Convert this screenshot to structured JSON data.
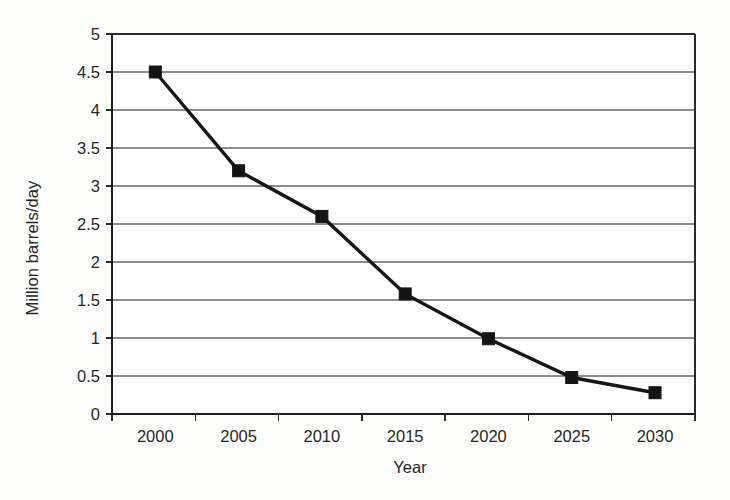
{
  "chart_data": {
    "type": "line",
    "title": "",
    "xlabel": "Year",
    "ylabel": "Million barrels/day",
    "x": [
      2000,
      2005,
      2010,
      2015,
      2020,
      2025,
      2030
    ],
    "categories": [
      "2000",
      "2005",
      "2010",
      "2015",
      "2020",
      "2025",
      "2030"
    ],
    "values": [
      4.5,
      3.2,
      2.6,
      1.58,
      0.99,
      0.48,
      0.28
    ],
    "series": [
      {
        "name": "Million barrels/day",
        "values": [
          4.5,
          3.2,
          2.6,
          1.58,
          0.99,
          0.48,
          0.28
        ]
      }
    ],
    "xlim": [
      2000,
      2030
    ],
    "ylim": [
      0,
      5
    ],
    "yticks": [
      0,
      0.5,
      1,
      1.5,
      2,
      2.5,
      3,
      3.5,
      4,
      4.5,
      5
    ],
    "ytick_labels": [
      "0",
      "0.5",
      "1",
      "1.5",
      "2",
      "2.5",
      "3",
      "3.5",
      "4",
      "4.5",
      "5"
    ],
    "xtick_labels": [
      "2000",
      "2005",
      "2010",
      "2015",
      "2020",
      "2025",
      "2030"
    ],
    "grid": "horizontal",
    "legend": "none",
    "marker": "filled-square",
    "line_color": "#161616",
    "marker_color": "#141414",
    "grid_color": "#8d8d8d",
    "background_color": "#ffffff"
  },
  "axes": {
    "y_title": "Million barrels/day",
    "x_title": "Year"
  }
}
